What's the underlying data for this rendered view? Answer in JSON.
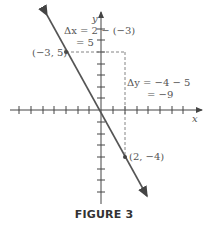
{
  "figure": {
    "caption": "FIGURE 3",
    "axes": {
      "x_label": "x",
      "y_label": "y"
    },
    "points": [
      {
        "label": "(−3, 5)",
        "x": -3,
        "y": 5
      },
      {
        "label": "(2, −4)",
        "x": 2,
        "y": -4
      }
    ],
    "annotations": {
      "delta_x_line1": "Δx = 2 − (−3)",
      "delta_x_line2": "= 5",
      "delta_y_line1": "Δy = −4 − 5",
      "delta_y_line2": "= −9"
    },
    "colors": {
      "line": "#555555",
      "axis": "#444444",
      "dashed": "#777777"
    }
  }
}
